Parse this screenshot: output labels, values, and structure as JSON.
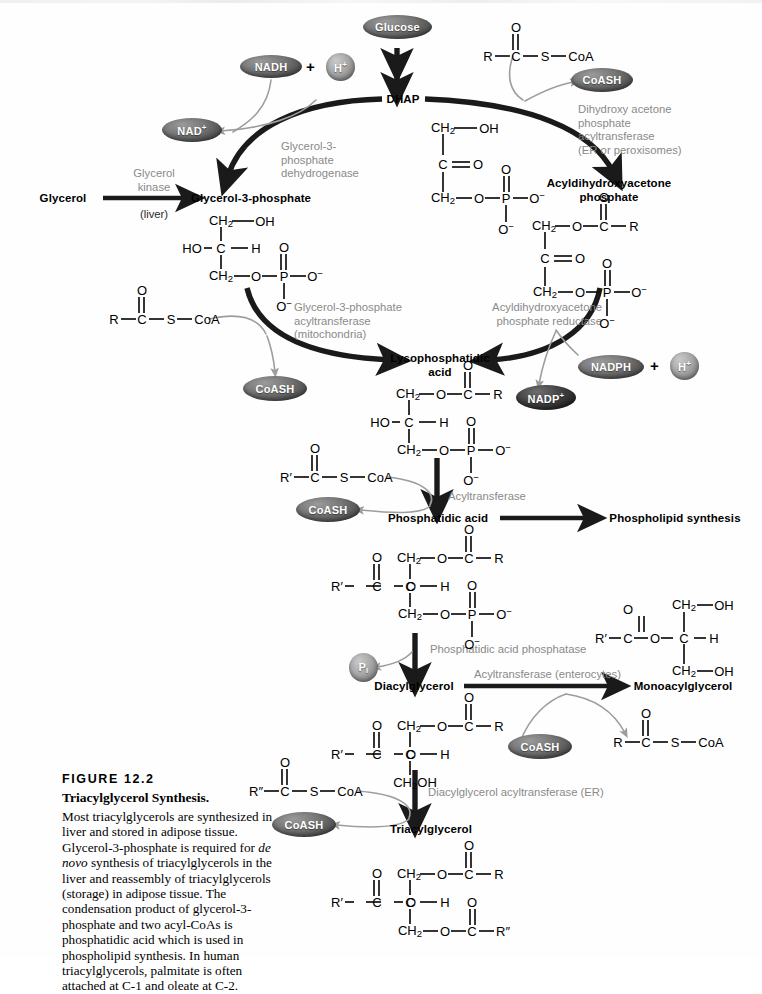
{
  "figure": {
    "number": "FIGURE 12.2",
    "title": "Triacylglycerol Synthesis.",
    "body_part1": "Most triacylglycerols are synthesized in liver and stored in adipose tissue. Glycerol-3-phosphate is required for ",
    "body_italic": "de novo",
    "body_part2": " synthesis of triacylglycerols in the liver and reassembly of triacylglycerols (storage) in adipose tissue. The condensation product of glycerol-3-phosphate and two acyl-CoAs is phosphatidic acid which is used in phospholipid synthesis. In human triacylglycerols, palmitate is often attached at C-1 and oleate at C-2."
  },
  "colors": {
    "arrow_main": "#1a1a1a",
    "arrow_minor": "#9d9d9d",
    "enzyme_text": "#8a8a8a",
    "bubble_mid": "#6f6f6f",
    "bubble_light": "#a8a8a8",
    "bubble_dark": "#2b2b2b",
    "page_background": "#fefefe"
  },
  "metabolites": {
    "glucose": "Glucose",
    "dhap": "DHAP",
    "glycerol": "Glycerol",
    "glycerol_3_phosphate": "Glycerol-3-phosphate",
    "acyldihydroxyacetone_phosphate_l1": "Acyldihydroxyacetone",
    "acyldihydroxyacetone_phosphate_l2": "phosphate",
    "lysophosphatidic_acid_l1": "Lysophosphatidic",
    "lysophosphatidic_acid_l2": "acid",
    "phosphatidic_acid": "Phosphatidic acid",
    "phospholipid_synthesis": "Phospholipid synthesis",
    "diacylglycerol": "Diacylglycerol",
    "monoacylglycerol": "Monoacylglycerol",
    "triacylglycerol": "Triacylglycerol"
  },
  "cofactors": {
    "nadh": "NADH",
    "nad_plus": "NAD",
    "nad_plus_charge": "+",
    "h_plus": "H",
    "h_plus_charge": "+",
    "nadph": "NADPH",
    "nadp_plus": "NADP",
    "nadp_plus_charge": "+",
    "coash": "CoASH",
    "pi": "P",
    "pi_sub": "i",
    "plus_sign": "+"
  },
  "enzymes": {
    "glycerol_kinase": "Glycerol\nkinase",
    "glycerol_kinase_loc": "(liver)",
    "g3p_dehydrogenase": "Glycerol-3-\nphosphate\ndehydrogenase",
    "dhap_acyltransferase": "Dihydroxy acetone\nphosphate\nacyltransferase\n(ER or peroxisomes)",
    "g3p_acyltransferase": "Glycerol-3-phosphate\nacyltransferase\n(mitochondria)",
    "adhap_reductase": "Acyldihydroxyacetone\nphosphate reductase",
    "acyltransferase": "Acyltransferase",
    "pa_phosphatase": "Phosphatidic acid phosphatase",
    "acyltransferase_enterocytes": "Acyltransferase  (enterocytes)",
    "dag_acyltransferase": "Diacylglycerol acyltransferase  (ER)"
  },
  "acyl_thioesters": {
    "top_right": {
      "r": "R",
      "carbonyl": "C",
      "oxygen": "O",
      "sulfur": "S",
      "coa": "CoA"
    },
    "mid_left": {
      "r": "R",
      "carbonyl": "C",
      "oxygen": "O",
      "sulfur": "S",
      "coa": "CoA"
    },
    "lower_left": {
      "r": "R′",
      "carbonyl": "C",
      "oxygen": "O",
      "sulfur": "S",
      "coa": "CoA"
    },
    "bottom_left": {
      "r": "R″",
      "carbonyl": "C",
      "oxygen": "O",
      "sulfur": "S",
      "coa": "CoA"
    },
    "bottom_right": {
      "r": "R",
      "carbonyl": "C",
      "oxygen": "O",
      "sulfur": "S",
      "coa": "CoA"
    }
  },
  "structures": {
    "dhap": {
      "name": "dihydroxyacetone phosphate",
      "atoms": [
        "CH2",
        "OH",
        "C",
        "O",
        "CH2",
        "O",
        "P",
        "O−",
        "O−",
        "O"
      ]
    },
    "glycerol_3_phosphate": {
      "name": "glycerol-3-phosphate",
      "atoms": [
        "CH2",
        "OH",
        "HO",
        "C",
        "H",
        "CH2",
        "O",
        "P",
        "O−",
        "O−",
        "O"
      ]
    },
    "acyl_dhap": {
      "name": "acyldihydroxyacetone phosphate",
      "atoms": [
        "CH2",
        "O",
        "C",
        "R",
        "O",
        "C",
        "O",
        "CH2",
        "O",
        "P",
        "O−",
        "O−"
      ]
    },
    "lysophosphatidic_acid": {
      "name": "lysophosphatidic acid",
      "atoms": [
        "CH2",
        "O",
        "C",
        "R",
        "O",
        "HO",
        "C",
        "H",
        "CH2",
        "O",
        "P",
        "O−",
        "O−"
      ]
    },
    "phosphatidic_acid": {
      "name": "phosphatidic acid",
      "atoms": [
        "CH2",
        "O",
        "C",
        "R",
        "O",
        "R′",
        "C",
        "O",
        "C",
        "H",
        "CH2",
        "O",
        "P",
        "O−",
        "O−"
      ]
    },
    "monoacylglycerol": {
      "name": "monoacylglycerol",
      "atoms": [
        "R′",
        "C",
        "O",
        "O",
        "CH2",
        "OH",
        "C",
        "H",
        "CH2",
        "OH"
      ]
    },
    "diacylglycerol": {
      "name": "diacylglycerol",
      "atoms": [
        "CH2",
        "O",
        "C",
        "R",
        "O",
        "R′",
        "C",
        "O",
        "C",
        "H",
        "CH2OH"
      ]
    },
    "triacylglycerol": {
      "name": "triacylglycerol",
      "atoms": [
        "CH2",
        "O",
        "C",
        "R",
        "O",
        "R′",
        "C",
        "O",
        "C",
        "H",
        "CH2",
        "O",
        "C",
        "R″",
        "O"
      ]
    }
  },
  "labels": {
    "CH2": "CH",
    "CH2_sub": "2",
    "CH2OH": "CH",
    "CH2OH_sub": "2",
    "CH2OH_tail": "OH",
    "OH": "OH",
    "HO": "HO",
    "O": "O",
    "C": "C",
    "H": "H",
    "P": "P",
    "S": "S",
    "R": "R",
    "R_prime": "R′",
    "R_dprime": "R″",
    "O_minus": "O",
    "minus": "−",
    "CoA": "CoA"
  }
}
